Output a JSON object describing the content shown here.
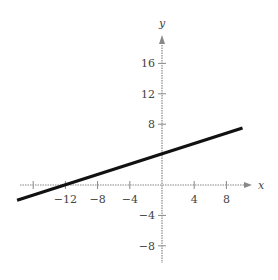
{
  "chart_data": {
    "type": "line",
    "title": "",
    "xlabel": "x",
    "ylabel": "y",
    "xlim": [
      -18,
      11
    ],
    "ylim": [
      -10,
      19
    ],
    "grid": false,
    "x_ticks": [
      -16,
      -12,
      -8,
      -4,
      4,
      8
    ],
    "x_tick_labels": [
      "",
      "−12",
      "−8",
      "−4",
      "4",
      "8"
    ],
    "y_ticks": [
      16,
      12,
      8,
      -4,
      -8
    ],
    "y_tick_labels": [
      "16",
      "12",
      "8",
      "−4",
      "−8"
    ],
    "series": [
      {
        "name": "line",
        "x": [
          -18,
          10
        ],
        "y": [
          -2,
          7.5
        ],
        "color": "#111111",
        "equation_estimate": "y ≈ 0.34x + 4.2"
      }
    ],
    "legend": null
  },
  "colors": {
    "axis": "#888888",
    "line": "#111111",
    "text": "#444444"
  }
}
